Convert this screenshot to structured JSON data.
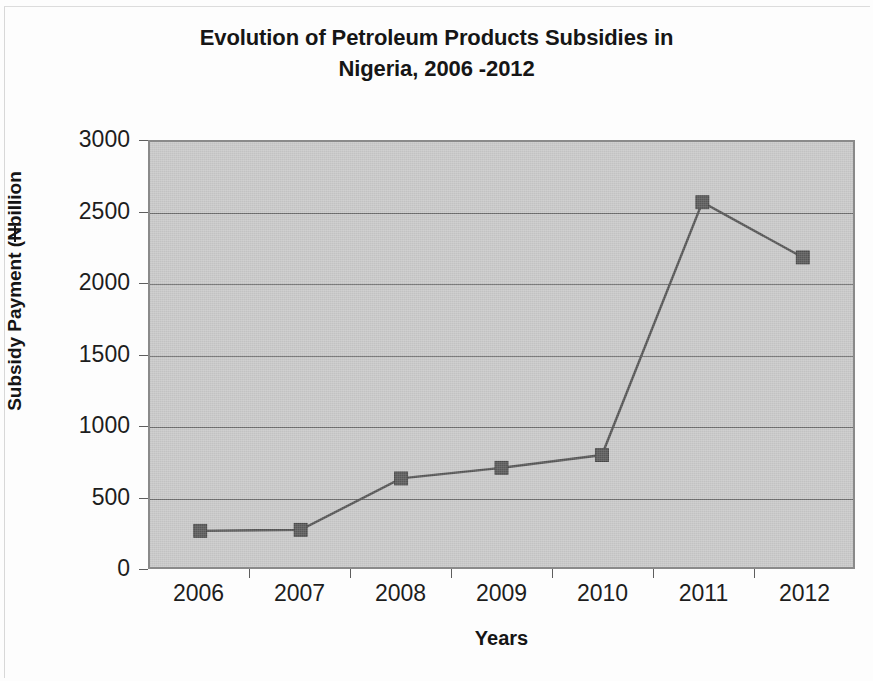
{
  "document": {
    "kind": "scanned-figure"
  },
  "chart_data": {
    "type": "line",
    "title": "Evolution of Petroleum Products Subsidies in Nigeria, 2006 -2012",
    "title_lines": [
      "Evolution of Petroleum Products Subsidies in",
      "Nigeria, 2006 -2012"
    ],
    "xlabel": "Years",
    "ylabel": "Subsidy Payment (Nbillion",
    "ylabel_parts": {
      "before": "Subsidy Payment (",
      "currency_symbol": "N",
      "after": "billion"
    },
    "categories": [
      "2006",
      "2007",
      "2008",
      "2009",
      "2010",
      "2011",
      "2012"
    ],
    "values": [
      255,
      262,
      625,
      700,
      790,
      2575,
      2185
    ],
    "series": [
      {
        "name": "Subsidy Payment",
        "values": [
          255,
          262,
          625,
          700,
          790,
          2575,
          2185
        ]
      }
    ],
    "ylim": [
      0,
      3000
    ],
    "ytick_step": 500,
    "yticks": [
      "3000",
      "2500",
      "2000",
      "1500",
      "1000",
      "500",
      "0"
    ],
    "ytick_values": [
      3000,
      2500,
      2000,
      1500,
      1000,
      500,
      0
    ],
    "xticks": [
      "2006",
      "2007",
      "2008",
      "2009",
      "2010",
      "2011",
      "2012"
    ],
    "grid": "horizontal",
    "legend": "none",
    "marker": "square",
    "colors": {
      "plot_background": "#c9c9c9",
      "plot_border": "#8a8a8a",
      "gridline": "#6d6d6d",
      "series_line": "#555555",
      "series_marker": "#5a5a5a",
      "text": "#1d1d1d",
      "page_background": "#fdfdfd"
    }
  }
}
